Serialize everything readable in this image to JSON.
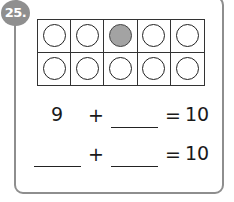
{
  "problem": {
    "number_label": "25.",
    "ten_frame": {
      "rows": 2,
      "columns": 5,
      "counters": [
        {
          "filled": false
        },
        {
          "filled": false
        },
        {
          "filled": true
        },
        {
          "filled": false
        },
        {
          "filled": false
        },
        {
          "filled": false
        },
        {
          "filled": false
        },
        {
          "filled": false
        },
        {
          "filled": false
        },
        {
          "filled": false
        }
      ],
      "filled_color": "#a3a3a3"
    },
    "equations": [
      {
        "addend1": "9",
        "plus": "+",
        "addend2": "",
        "equals": "=",
        "total": "10"
      },
      {
        "addend1": "",
        "plus": "+",
        "addend2": "",
        "equals": "=",
        "total": "10"
      }
    ]
  }
}
